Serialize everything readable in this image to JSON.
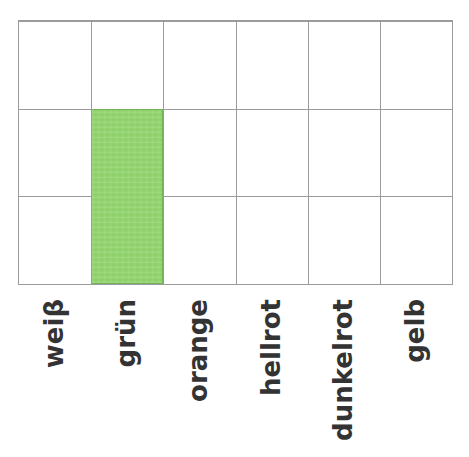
{
  "chart_data": {
    "type": "bar",
    "title": "",
    "subtitle": "",
    "xlabel": "",
    "ylabel": "",
    "categories": [
      "weiβ",
      "grün",
      "orange",
      "hellrot",
      "dunkelrot",
      "gelb"
    ],
    "values": [
      0,
      2,
      0,
      0,
      0,
      0
    ],
    "ylim": [
      0,
      3
    ],
    "y_gridlines": [
      0,
      1,
      2,
      3
    ],
    "y_tick_labels": [],
    "x_tick_labels": [
      "weiβ",
      "grün",
      "orange",
      "hellrot",
      "dunkelrot",
      "gelb"
    ],
    "grid": true,
    "legend": false,
    "legend_position": "none",
    "annotations": [],
    "series": [
      {
        "name": "",
        "values": [
          0,
          2,
          0,
          0,
          0,
          0
        ],
        "bar_colors": [
          "#92d46e",
          "#92d46e",
          "#92d46e",
          "#92d46e",
          "#92d46e",
          "#92d46e"
        ]
      }
    ]
  },
  "colors": {
    "bar_fill": "#92d46e",
    "bar_stroke": "#74b257",
    "grid_line": "#9b9b9b",
    "plot_background": "#ffffff",
    "label_text": "#333333",
    "page_background": "#ffffff"
  },
  "axis": {
    "rows": 3,
    "columns": 6,
    "column_count_label": "6",
    "row_count_label": "3"
  }
}
